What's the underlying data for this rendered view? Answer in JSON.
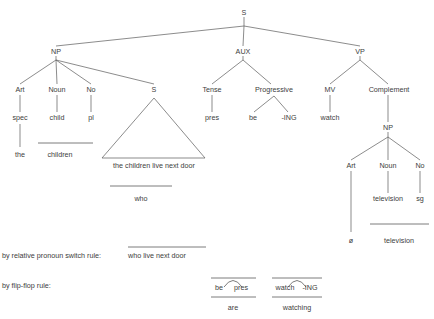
{
  "diagram": {
    "root": {
      "label": "S"
    },
    "nodes": {
      "np_subject": "NP",
      "aux": "AUX",
      "vp": "VP",
      "art_subject": "Art",
      "noun_subject": "Noun",
      "no_subject": "No",
      "s_embedded": "S",
      "tense": "Tense",
      "progressive": "Progressive",
      "mv": "MV",
      "complement": "Complement",
      "np_object": "NP",
      "art_object": "Art",
      "noun_object": "Noun",
      "no_object": "No"
    },
    "terminals": {
      "spec": "spec",
      "child": "child",
      "pl": "pl",
      "pres": "pres",
      "be": "be",
      "ing": "-ING",
      "watch": "watch",
      "television": "television",
      "sg": "sg"
    },
    "realizations": {
      "the": "the",
      "children": "children",
      "embedded_clause": "the children live next door",
      "who": "who",
      "null_article": "ø",
      "television_final": "television"
    },
    "rules": [
      {
        "name": "relative-pronoun-switch",
        "label": "by relative pronoun switch rule:",
        "output": "who live next door"
      },
      {
        "name": "flip-flop",
        "label": "by flip-flop rule:",
        "groups": [
          {
            "left": "be",
            "right": "pres",
            "result": "are"
          },
          {
            "left": "watch",
            "right": "-ING",
            "result": "watching"
          }
        ]
      }
    ],
    "colors": {
      "ink": "#3d3d3d",
      "line": "#5a5a5a",
      "background": "#ffffff"
    }
  }
}
